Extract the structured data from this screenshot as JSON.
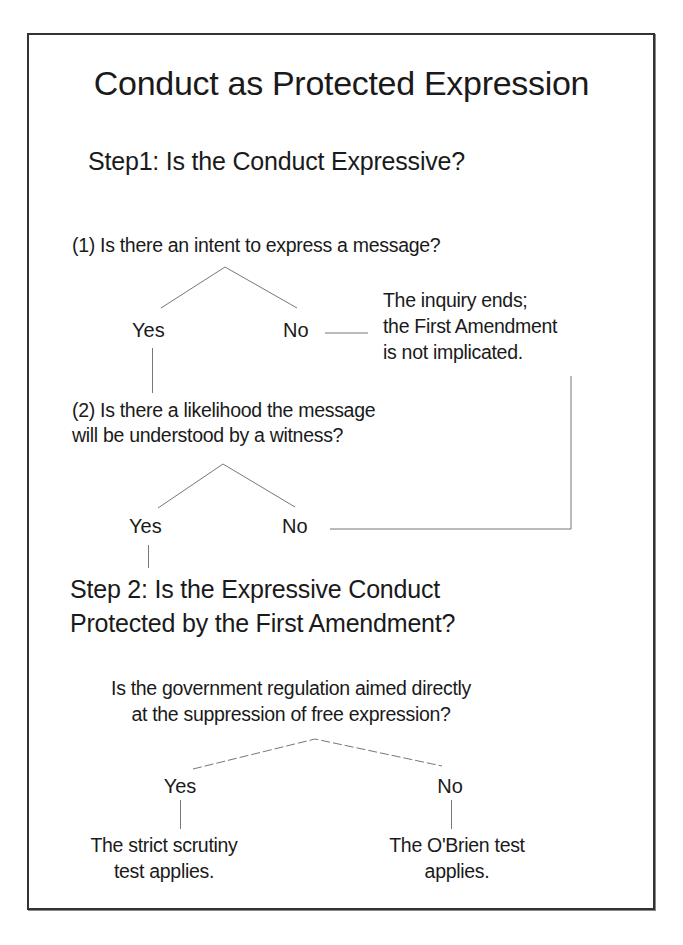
{
  "diagram": {
    "title": "Conduct as Protected Expression",
    "step1": {
      "heading": "Step1: Is the Conduct Expressive?",
      "question1": {
        "text": "(1) Is there an intent to express a message?",
        "yes_label": "Yes",
        "no_label": "No",
        "no_outcome": [
          "The inquiry ends;",
          "the First Amendment",
          "is not implicated."
        ]
      },
      "question2": {
        "lines": [
          "(2) Is there a likelihood the message",
          "will be understood by a witness?"
        ],
        "yes_label": "Yes",
        "no_label": "No"
      }
    },
    "step2": {
      "heading_lines": [
        "Step 2: Is the Expressive Conduct",
        "Protected by the First Amendment?"
      ],
      "question": {
        "lines": [
          "Is the government regulation aimed directly",
          "at the suppression of free expression?"
        ],
        "yes_label": "Yes",
        "no_label": "No",
        "yes_outcome": [
          "The strict scrutiny",
          "test applies."
        ],
        "no_outcome": [
          "The O'Brien test",
          "applies."
        ]
      }
    }
  },
  "colors": {
    "text": "#1a1a1a",
    "frame": "#333333",
    "connector": "#777777",
    "background": "#ffffff"
  }
}
